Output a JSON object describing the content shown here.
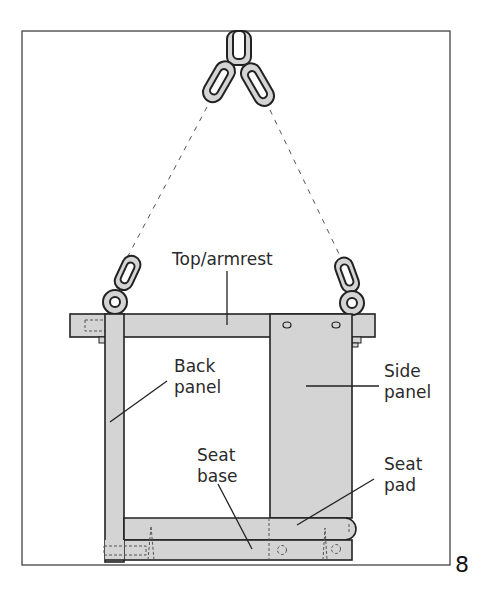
{
  "figure": {
    "number": "8",
    "colors": {
      "part_fill": "#d4d4d4",
      "outline": "#222222",
      "background": "#ffffff"
    }
  },
  "labels": {
    "top_armrest": "Top/armrest",
    "back_panel_line1": "Back",
    "back_panel_line2": "panel",
    "side_panel_line1": "Side",
    "side_panel_line2": "panel",
    "seat_base_line1": "Seat",
    "seat_base_line2": "base",
    "seat_pad_line1": "Seat",
    "seat_pad_line2": "pad"
  }
}
